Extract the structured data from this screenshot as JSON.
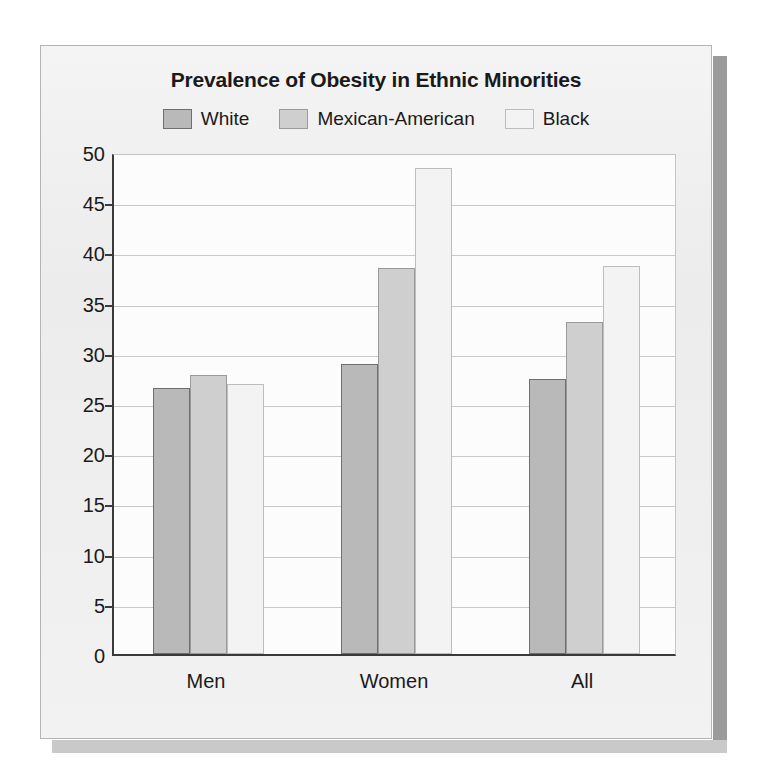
{
  "chart_data": {
    "type": "bar",
    "title": "Prevalence of Obesity in Ethnic Minorities",
    "xlabel": "",
    "ylabel": "",
    "categories": [
      "Men",
      "Women",
      "All"
    ],
    "series": [
      {
        "name": "White",
        "values": [
          26.5,
          28.9,
          27.4
        ],
        "color": "#b9b9b9",
        "border_color": "#6f6f6f"
      },
      {
        "name": "Mexican-American",
        "values": [
          27.8,
          38.4,
          33.1
        ],
        "color": "#cfcfcf",
        "border_color": "#9a9a9a"
      },
      {
        "name": "Black",
        "values": [
          26.9,
          48.4,
          38.6
        ],
        "color": "#f3f3f3",
        "border_color": "#bdbdbd"
      }
    ],
    "ylim": [
      0,
      50
    ],
    "yticks": [
      0,
      5,
      10,
      15,
      20,
      25,
      30,
      35,
      40,
      45,
      50
    ],
    "ytick_labels": [
      "0",
      "5",
      "10",
      "15",
      "20",
      "25",
      "30",
      "35",
      "40",
      "45",
      "50"
    ],
    "grid": true,
    "legend_position": "top"
  },
  "figure": {
    "background_color": "#ebebeb",
    "plot_background_color": "#fcfcfc",
    "border_color": "#b4b4b4",
    "axis_color": "#3a3a3a",
    "gridline_color": "#c9c9c9",
    "shadow_color": "#9b9b9b"
  }
}
